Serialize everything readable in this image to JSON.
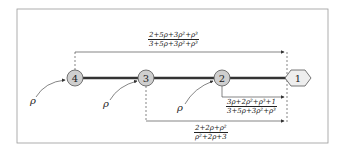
{
  "diagram": {
    "nodes": [
      {
        "id": "4",
        "label": "4",
        "shape": "circle"
      },
      {
        "id": "3",
        "label": "3",
        "shape": "circle"
      },
      {
        "id": "2",
        "label": "2",
        "shape": "circle"
      },
      {
        "id": "1",
        "label": "1",
        "shape": "hexagon"
      }
    ],
    "input_labels": [
      "ρ",
      "ρ",
      "ρ"
    ],
    "arrows": [
      {
        "from": "4",
        "to": "1",
        "numerator": "2+5ρ+3ρ²+ρ³",
        "denominator": "3+5ρ+3ρ²+ρ³"
      },
      {
        "from": "2",
        "to": "1",
        "numerator": "3ρ+2ρ²+ρ³+1",
        "denominator": "3+5ρ+3ρ²+ρ³"
      },
      {
        "from": "3",
        "to": "1",
        "numerator": "2+2ρ+ρ²",
        "denominator": "ρ²+2ρ+3"
      }
    ],
    "colors": {
      "node_fill": "#cfcfcf",
      "node_stroke": "#555555",
      "edge": "#333333",
      "frame": "#888888"
    }
  }
}
